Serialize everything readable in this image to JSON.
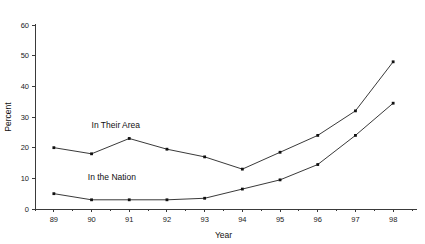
{
  "chart_data": {
    "type": "line",
    "title": "",
    "subtitle": "",
    "xlabel": "Year",
    "ylabel": "Percent",
    "categories": [
      "89",
      "90",
      "91",
      "92",
      "93",
      "94",
      "95",
      "96",
      "97",
      "98"
    ],
    "x": [
      89,
      90,
      91,
      92,
      93,
      94,
      95,
      96,
      97,
      98
    ],
    "xlim": [
      88.5,
      98.5
    ],
    "ylim": [
      0,
      60
    ],
    "yticks": [
      0,
      10,
      20,
      30,
      40,
      50,
      60
    ],
    "xticks": [
      "89",
      "90",
      "91",
      "92",
      "93",
      "94",
      "95",
      "96",
      "97",
      "98"
    ],
    "grid": false,
    "legend_position": "inline-annotation",
    "series": [
      {
        "name": "In Their Area",
        "values": [
          20,
          18,
          23,
          19.5,
          17,
          13,
          18.5,
          24,
          32,
          48
        ],
        "color": "#222222",
        "marker": "square",
        "label_x": 90.0,
        "label_y": 26.5
      },
      {
        "name": "In the Nation",
        "values": [
          5,
          3,
          3,
          3,
          3.5,
          6.5,
          9.5,
          14.5,
          24,
          34.5
        ],
        "color": "#222222",
        "marker": "square",
        "label_x": 89.9,
        "label_y": 9.5
      }
    ],
    "annotations": [
      {
        "text": "In Their Area",
        "x": 90.0,
        "y": 26.5
      },
      {
        "text": "In the Nation",
        "x": 89.9,
        "y": 9.5
      }
    ]
  },
  "axes": {
    "y_tick_labels": [
      "0",
      "10",
      "20",
      "30",
      "40",
      "50",
      "60"
    ],
    "x_tick_labels": [
      "89",
      "90",
      "91",
      "92",
      "93",
      "94",
      "95",
      "96",
      "97",
      "98"
    ],
    "y_axis_title": "Percent",
    "x_axis_title": "Year"
  },
  "colors": {
    "line": "#222222",
    "axis": "#3a3a3a",
    "text": "#111111",
    "background": "#ffffff"
  }
}
